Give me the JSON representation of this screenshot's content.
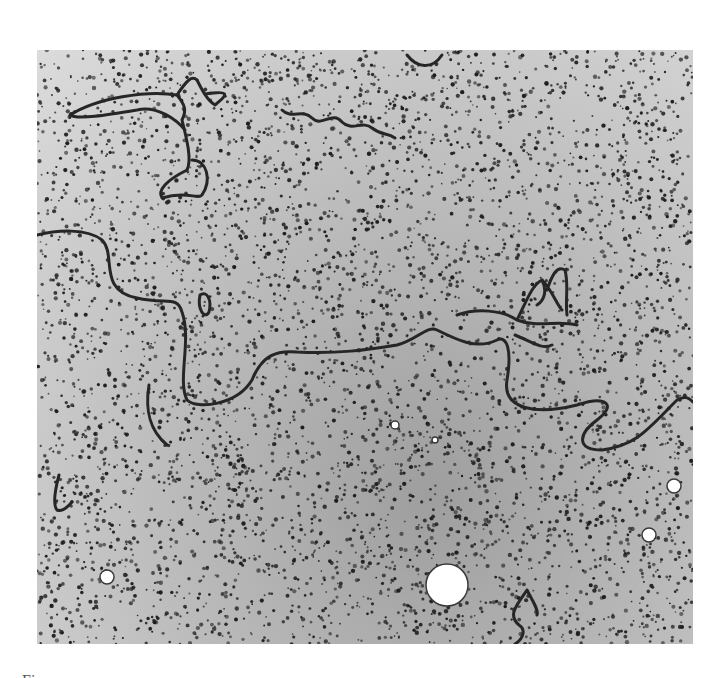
{
  "figure": {
    "caption_fragment": "Fi",
    "colors": {
      "background": "#ffffff",
      "grain": "#1e1e1e",
      "strand": "#262626",
      "field_light": "#dcdcdc",
      "field_dark": "#9e9e9e"
    }
  }
}
